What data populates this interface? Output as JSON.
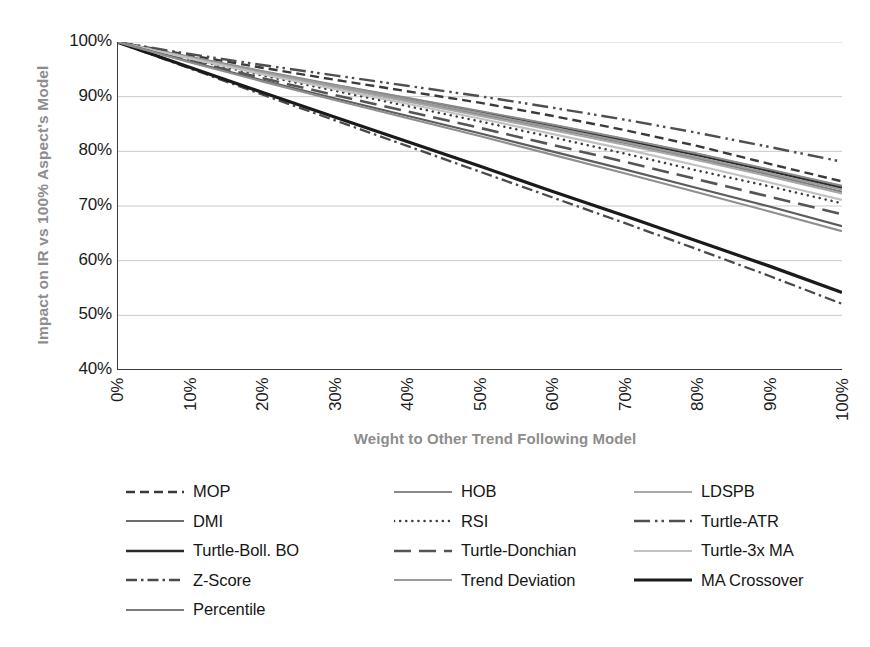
{
  "chart_data": {
    "type": "line",
    "title": "",
    "xlabel": "Weight to Other Trend Following Model",
    "ylabel": "Impact on IR vs 100% Aspect's Model",
    "xlim": [
      0,
      100
    ],
    "ylim": [
      40,
      100
    ],
    "grid": true,
    "legend_position": "bottom",
    "x": [
      0,
      10,
      20,
      30,
      40,
      50,
      60,
      70,
      80,
      90,
      100
    ],
    "xtick_labels": [
      "0%",
      "10%",
      "20%",
      "30%",
      "40%",
      "50%",
      "60%",
      "70%",
      "80%",
      "90%",
      "100%"
    ],
    "ytick_labels": [
      "100%",
      "90%",
      "80%",
      "70%",
      "60%",
      "50%",
      "40%"
    ],
    "ytick_values": [
      100,
      90,
      80,
      70,
      60,
      50,
      40
    ],
    "series": [
      {
        "name": "MOP",
        "style": "dashed",
        "color": "#3a3a3a",
        "width": 2.4,
        "values": [
          100,
          97.6,
          95.3,
          93.1,
          91.0,
          88.9,
          86.5,
          83.9,
          81.0,
          77.7,
          74.5
        ]
      },
      {
        "name": "DMI",
        "style": "solid",
        "color": "#6d6d6d",
        "width": 2.0,
        "values": [
          100,
          97.2,
          94.6,
          92.1,
          89.7,
          87.3,
          84.8,
          82.2,
          79.5,
          76.6,
          73.6
        ]
      },
      {
        "name": "Turtle-Boll. BO",
        "style": "solid",
        "color": "#2b2b2b",
        "width": 2.3,
        "values": [
          100,
          97.2,
          94.5,
          92.0,
          89.5,
          87.1,
          84.6,
          82.0,
          79.3,
          76.4,
          73.3
        ]
      },
      {
        "name": "Z-Score",
        "style": "dashdot",
        "color": "#4a4a4a",
        "width": 2.3,
        "values": [
          100,
          95.2,
          90.4,
          85.7,
          81.0,
          76.3,
          71.6,
          66.9,
          62.1,
          57.2,
          52.1
        ]
      },
      {
        "name": "Percentile",
        "style": "solid",
        "color": "#7d7d7d",
        "width": 2.0,
        "values": [
          100,
          97.1,
          94.4,
          91.8,
          89.3,
          86.8,
          84.2,
          81.5,
          78.7,
          75.7,
          72.6
        ]
      },
      {
        "name": "HOB",
        "style": "solid",
        "color": "#8a8a8a",
        "width": 1.9,
        "values": [
          100,
          97.3,
          94.7,
          92.2,
          89.8,
          87.4,
          84.9,
          82.3,
          79.6,
          76.7,
          73.7
        ]
      },
      {
        "name": "RSI",
        "style": "dotted",
        "color": "#3f3f3f",
        "width": 2.5,
        "values": [
          100,
          96.9,
          93.9,
          91.1,
          88.3,
          85.5,
          82.6,
          79.6,
          76.5,
          73.6,
          70.5
        ]
      },
      {
        "name": "Turtle-Donchian",
        "style": "longdash",
        "color": "#555555",
        "width": 2.6,
        "values": [
          100,
          96.6,
          93.4,
          90.3,
          87.3,
          84.3,
          81.2,
          78.1,
          74.9,
          71.7,
          68.5
        ]
      },
      {
        "name": "Trend Deviation",
        "style": "solid",
        "color": "#9a9a9a",
        "width": 2.0,
        "values": [
          100,
          97.2,
          94.5,
          92.0,
          89.5,
          87.0,
          84.4,
          81.7,
          78.9,
          76.0,
          73.0
        ]
      },
      {
        "name": "LDSPB",
        "style": "solid",
        "color": "#a8a8a8",
        "width": 2.0,
        "values": [
          100,
          97.1,
          94.3,
          91.7,
          89.1,
          86.5,
          83.9,
          81.2,
          78.4,
          75.4,
          72.3
        ]
      },
      {
        "name": "Turtle-ATR",
        "style": "longdashdotdot",
        "color": "#4f4f4f",
        "width": 2.4,
        "values": [
          100,
          97.8,
          95.8,
          93.9,
          92.0,
          90.1,
          88.0,
          85.8,
          83.4,
          80.8,
          78.1
        ]
      },
      {
        "name": "Turtle-3x MA",
        "style": "solid",
        "color": "#c2c2c2",
        "width": 2.2,
        "values": [
          100,
          97.0,
          94.1,
          91.4,
          88.7,
          86.0,
          83.2,
          80.4,
          77.4,
          74.3,
          71.1
        ]
      },
      {
        "name": "MA Crossover",
        "style": "solid",
        "color": "#1a1a1a",
        "width": 3.2,
        "values": [
          100,
          95.4,
          90.8,
          86.3,
          81.8,
          77.3,
          72.7,
          68.2,
          63.6,
          59.0,
          54.2
        ]
      },
      {
        "name": "Lower-Pair-A",
        "style": "solid",
        "color": "#5c5c5c",
        "width": 2.2,
        "values": [
          100,
          96.4,
          93.0,
          89.7,
          86.5,
          83.3,
          80.0,
          76.7,
          73.3,
          69.9,
          66.3
        ]
      },
      {
        "name": "Lower-Pair-B",
        "style": "solid",
        "color": "#8f8f8f",
        "width": 2.1,
        "values": [
          100,
          96.3,
          92.8,
          89.4,
          86.1,
          82.8,
          79.4,
          76.0,
          72.5,
          69.0,
          65.4
        ]
      }
    ],
    "legend_entries": [
      {
        "label": "MOP",
        "style": "dashed",
        "color": "#3a3a3a",
        "width": 2.4
      },
      {
        "label": "HOB",
        "style": "solid",
        "color": "#8a8a8a",
        "width": 1.9
      },
      {
        "label": "LDSPB",
        "style": "solid",
        "color": "#a8a8a8",
        "width": 2.0
      },
      {
        "label": "DMI",
        "style": "solid",
        "color": "#6d6d6d",
        "width": 2.0
      },
      {
        "label": "RSI",
        "style": "dotted",
        "color": "#3f3f3f",
        "width": 2.5
      },
      {
        "label": "Turtle-ATR",
        "style": "longdashdotdot",
        "color": "#4f4f4f",
        "width": 2.4
      },
      {
        "label": "Turtle-Boll. BO",
        "style": "solid",
        "color": "#2b2b2b",
        "width": 2.3
      },
      {
        "label": "Turtle-Donchian",
        "style": "longdash",
        "color": "#555555",
        "width": 2.6
      },
      {
        "label": "Turtle-3x MA",
        "style": "solid",
        "color": "#c2c2c2",
        "width": 2.2
      },
      {
        "label": "Z-Score",
        "style": "dashdot",
        "color": "#4a4a4a",
        "width": 2.3
      },
      {
        "label": "Trend Deviation",
        "style": "solid",
        "color": "#9a9a9a",
        "width": 2.0
      },
      {
        "label": "MA Crossover",
        "style": "solid",
        "color": "#1a1a1a",
        "width": 3.2
      },
      {
        "label": "Percentile",
        "style": "solid",
        "color": "#7d7d7d",
        "width": 2.0
      }
    ],
    "colors": {
      "axis": "#3b3b3b",
      "grid": "#c9c9c9",
      "tick_text": "#1b1b1b",
      "axis_title": "#8d8d8d",
      "legend_text": "#161616",
      "background": "#ffffff"
    }
  }
}
